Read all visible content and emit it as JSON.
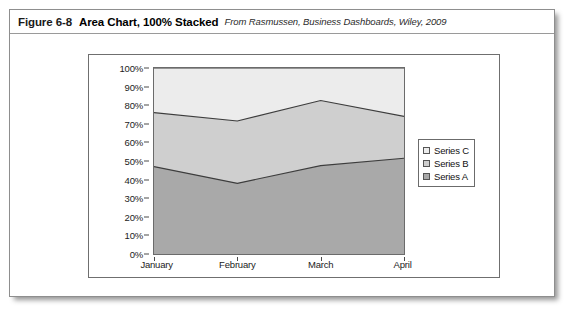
{
  "caption": {
    "figure_number": "Figure 6-8",
    "title": "Area Chart, 100% Stacked",
    "source": "From Rasmussen, Business Dashboards, Wiley, 2009"
  },
  "chart_data": {
    "type": "area",
    "stacked": "100%",
    "title": "",
    "xlabel": "",
    "ylabel": "",
    "categories": [
      "January",
      "February",
      "March",
      "April"
    ],
    "ylim": [
      0,
      100
    ],
    "ytick_labels": [
      "0%",
      "10%",
      "20%",
      "30%",
      "40%",
      "50%",
      "60%",
      "70%",
      "80%",
      "90%",
      "100%"
    ],
    "ytick_values": [
      0,
      10,
      20,
      30,
      40,
      50,
      60,
      70,
      80,
      90,
      100
    ],
    "grid": false,
    "legend_position": "right",
    "series": [
      {
        "name": "Series A",
        "color": "#a9a9a9",
        "values": [
          47,
          38,
          47.5,
          51.5
        ],
        "cumulative": [
          47,
          38,
          47.5,
          51.5
        ]
      },
      {
        "name": "Series B",
        "color": "#cfcfcf",
        "values": [
          29,
          33.5,
          35,
          22.5
        ],
        "cumulative": [
          76,
          71.5,
          82.5,
          74
        ]
      },
      {
        "name": "Series C",
        "color": "#ececec",
        "values": [
          24,
          28.5,
          17.5,
          26
        ],
        "cumulative": [
          100,
          100,
          100,
          100
        ]
      }
    ],
    "legend_order": [
      "Series C",
      "Series B",
      "Series A"
    ]
  },
  "colors": {
    "series_a": "#a9a9a9",
    "series_b": "#cfcfcf",
    "series_c": "#ececec",
    "axis_line": "#4a4a4a",
    "plot_border": "#6b6b6b",
    "figure_border": "#8e8e8e"
  }
}
